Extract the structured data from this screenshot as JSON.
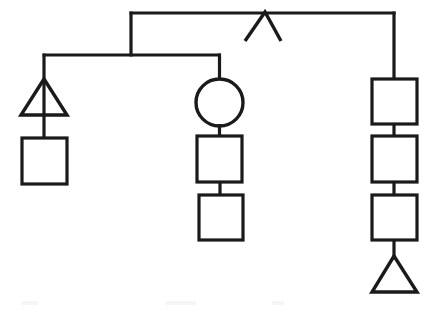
{
  "diagram": {
    "type": "pedigree-kinship-diagram",
    "title": "",
    "background_color": "#ffffff",
    "stroke_color": "#1a1a1a",
    "stroke_width": 3.2,
    "canvas": {
      "width": 427,
      "height": 311
    },
    "legend": [],
    "labels": [],
    "nodes": [
      {
        "id": "apex-caret",
        "shape": "caret-up",
        "label": "",
        "apex": {
          "x": 265,
          "y": 12
        },
        "left_leg": {
          "x": 245,
          "y": 41
        },
        "right_leg": {
          "x": 281,
          "y": 41
        }
      },
      {
        "id": "left-triangle",
        "shape": "triangle",
        "label": "",
        "apex": {
          "x": 44,
          "y": 79
        },
        "base_y": 115,
        "left_x": 21,
        "right_x": 67
      },
      {
        "id": "left-square",
        "shape": "square",
        "label": "",
        "x": 22,
        "y": 138,
        "width": 45,
        "height": 46
      },
      {
        "id": "middle-circle",
        "shape": "circle",
        "label": "",
        "cx": 219.5,
        "cy": 102.5,
        "r": 23.5
      },
      {
        "id": "middle-square-1",
        "shape": "square",
        "label": "",
        "x": 197,
        "y": 136,
        "width": 45,
        "height": 46
      },
      {
        "id": "middle-square-2",
        "shape": "square",
        "label": "",
        "x": 199,
        "y": 195,
        "width": 44,
        "height": 45
      },
      {
        "id": "right-square-1",
        "shape": "square",
        "label": "",
        "x": 372,
        "y": 79,
        "width": 45,
        "height": 45
      },
      {
        "id": "right-square-2",
        "shape": "square",
        "label": "",
        "x": 372,
        "y": 136,
        "width": 45,
        "height": 46
      },
      {
        "id": "right-square-3",
        "shape": "square",
        "label": "",
        "x": 372,
        "y": 195,
        "width": 45,
        "height": 45
      },
      {
        "id": "right-triangle",
        "shape": "triangle",
        "label": "",
        "apex": {
          "x": 394,
          "y": 256
        },
        "base_y": 292,
        "left_x": 372,
        "right_x": 417
      }
    ],
    "edges": [
      {
        "id": "top-sibship-bar",
        "from": "left-branch-corner",
        "to": "right-branch-corner",
        "points": "131,13 394,13",
        "orientation": "horizontal"
      },
      {
        "id": "top-bar-left-drop",
        "from": "top-sibship-bar",
        "to": "second-sibship-bar",
        "points": "131,13 131,55",
        "orientation": "vertical"
      },
      {
        "id": "top-bar-right-drop",
        "from": "top-sibship-bar",
        "to": "right-square-1",
        "points": "394,13 394,79",
        "orientation": "vertical"
      },
      {
        "id": "second-sibship-bar",
        "from": "left-triangle-stem",
        "to": "middle-circle-stem",
        "points": "44,55 219,55",
        "orientation": "horizontal"
      },
      {
        "id": "left-stem",
        "from": "second-sibship-bar",
        "to": "left-triangle",
        "points": "44,55 44,138",
        "orientation": "vertical"
      },
      {
        "id": "middle-stem",
        "from": "second-sibship-bar",
        "to": "middle-circle",
        "points": "219,55 219,79",
        "orientation": "vertical"
      },
      {
        "id": "middle-circle-to-square1",
        "from": "middle-circle",
        "to": "middle-square-1",
        "points": "219,126 219,136",
        "orientation": "vertical"
      },
      {
        "id": "middle-square1-to-square2",
        "from": "middle-square-1",
        "to": "middle-square-2",
        "points": "220,182 220,195",
        "orientation": "vertical"
      },
      {
        "id": "right-square1-to-square2",
        "from": "right-square-1",
        "to": "right-square-2",
        "points": "394,124 394,136",
        "orientation": "vertical"
      },
      {
        "id": "right-square2-to-square3",
        "from": "right-square-2",
        "to": "right-square-3",
        "points": "394,182 394,195",
        "orientation": "vertical"
      },
      {
        "id": "right-square3-to-triangle",
        "from": "right-square-3",
        "to": "right-triangle",
        "points": "394,240 394,258",
        "orientation": "vertical"
      }
    ]
  }
}
